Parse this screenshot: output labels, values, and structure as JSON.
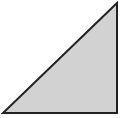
{
  "diagram": {
    "shape": "right-triangle",
    "vertices": [
      [
        117,
        3
      ],
      [
        3,
        113
      ],
      [
        117,
        113
      ]
    ],
    "fill_color": "#d2d2d2",
    "stroke_color": "#222222",
    "stroke_width": 2,
    "background": "#ffffff"
  }
}
